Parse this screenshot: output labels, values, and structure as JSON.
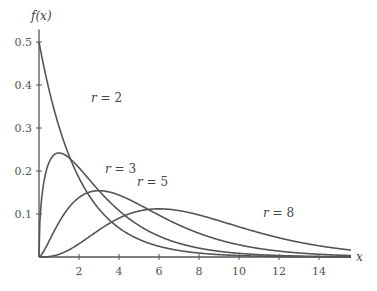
{
  "chart_data": {
    "type": "line",
    "title": "",
    "xlabel": "x",
    "ylabel": "f(x)",
    "xlim": [
      0,
      15.6
    ],
    "ylim": [
      0,
      0.52
    ],
    "grid": false,
    "legend": "inline labels on curves",
    "x_ticks": [
      "2",
      "4",
      "6",
      "8",
      "10",
      "12",
      "14"
    ],
    "y_ticks": [
      "0.1",
      "0.2",
      "0.3",
      "0.4",
      "0.5"
    ],
    "series": [
      {
        "name": "r = 2",
        "r": 2,
        "mode_x": 0,
        "peak_y": 0.5,
        "label_pos": [
          2.6,
          0.36
        ]
      },
      {
        "name": "r = 3",
        "r": 3,
        "mode_x": 1,
        "peak_y": 0.242,
        "label_pos": [
          3.3,
          0.195
        ]
      },
      {
        "name": "r = 5",
        "r": 5,
        "mode_x": 3,
        "peak_y": 0.154,
        "label_pos": [
          4.9,
          0.165
        ]
      },
      {
        "name": "r = 8",
        "r": 8,
        "mode_x": 6,
        "peak_y": 0.112,
        "label_pos": [
          11.2,
          0.093
        ]
      }
    ]
  },
  "labels": {
    "x_axis": "x",
    "y_axis": "f(x)",
    "r_prefix": "r",
    "eq": " = "
  },
  "colors": {
    "curve": "#555555",
    "axis": "#555555"
  }
}
